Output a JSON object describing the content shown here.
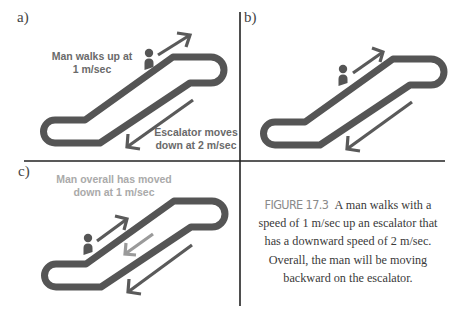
{
  "panels": {
    "a": {
      "label": "a)",
      "note_up_line1": "Man walks up at",
      "note_up_line2": "1 m/sec",
      "note_down_line1": "Escalator moves",
      "note_down_line2": "down at 2 m/sec"
    },
    "b": {
      "label": "b)"
    },
    "c": {
      "label": "c)",
      "note_line1": "Man overall has moved",
      "note_line2": "down at 1 m/sec"
    }
  },
  "caption": {
    "figure_number": "FIGURE 17.3",
    "text": "A man walks with a speed of 1 m/sec up an escalator that has a downward speed of 2 m/sec. Overall, the man will be moving backward on the escalator."
  },
  "colors": {
    "escalator": "#555555",
    "arrow": "#5a5a5a",
    "net_arrow": "#9a9a9a",
    "note_text": "#6a6a6a",
    "note_text_light": "#aaaaaa",
    "divider": "#222222"
  },
  "quantities": {
    "man_speed": "1 m/sec",
    "escalator_speed": "2 m/sec",
    "net_speed": "1 m/sec"
  }
}
